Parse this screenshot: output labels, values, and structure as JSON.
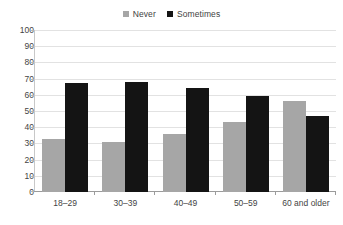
{
  "chart_data": {
    "type": "bar",
    "title": "",
    "subtitle": "",
    "xlabel": "",
    "ylabel": "",
    "categories": [
      "18–29",
      "30–39",
      "40–49",
      "50–59",
      "60 and older"
    ],
    "series": [
      {
        "name": "Never",
        "color": "#a6a6a6",
        "values": [
          33,
          31,
          36,
          43,
          56
        ]
      },
      {
        "name": "Sometimes",
        "color": "#141414",
        "values": [
          67,
          68,
          64,
          59,
          47
        ]
      }
    ],
    "ylim": [
      0,
      100
    ],
    "ytick_step": 10,
    "yticks": [
      "100",
      "90",
      "80",
      "70",
      "60",
      "50",
      "40",
      "30",
      "20",
      "10",
      "0"
    ],
    "grid": true,
    "grid_axis": "y",
    "legend_position": "top-center",
    "annotations": []
  },
  "legend": {
    "entries": [
      {
        "label": "Never",
        "swatch": "legend-swatch-never"
      },
      {
        "label": "Sometimes",
        "swatch": "legend-swatch-sometimes"
      }
    ]
  },
  "colors": {
    "never": "#a6a6a6",
    "sometimes": "#141414",
    "gridline": "#e2e2e2",
    "axis": "#9b9b9b",
    "text": "#444444",
    "background": "#ffffff"
  }
}
